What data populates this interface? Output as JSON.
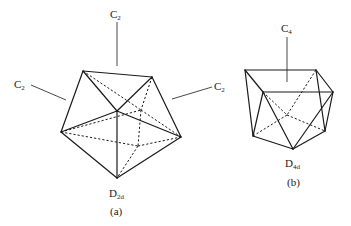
{
  "figure": {
    "panels": [
      {
        "id": "a",
        "caption": "(a)",
        "point_group": {
          "main": "D",
          "sub": "2d"
        },
        "axes": [
          {
            "label_main": "C",
            "label_sub": "2",
            "position": "top"
          },
          {
            "label_main": "C",
            "label_sub": "2",
            "position": "left"
          },
          {
            "label_main": "C",
            "label_sub": "2",
            "position": "right"
          }
        ],
        "vertices": {
          "TL": [
            83,
            71
          ],
          "TR": [
            152,
            77
          ],
          "C": [
            117,
            111
          ],
          "L": [
            61,
            132
          ],
          "R": [
            181,
            137
          ],
          "B": [
            117,
            178
          ],
          "H1": [
            141,
            110
          ],
          "H2": [
            138,
            146
          ]
        },
        "solid_edges": [
          [
            "TL",
            "TR"
          ],
          [
            "TL",
            "L"
          ],
          [
            "TL",
            "C"
          ],
          [
            "TR",
            "C"
          ],
          [
            "TR",
            "R"
          ],
          [
            "C",
            "L"
          ],
          [
            "C",
            "R"
          ],
          [
            "C",
            "B"
          ],
          [
            "L",
            "B"
          ],
          [
            "R",
            "B"
          ]
        ],
        "hidden_edges": [
          [
            "TL",
            "H1"
          ],
          [
            "H1",
            "R"
          ],
          [
            "TR",
            "H1"
          ],
          [
            "H1",
            "H2"
          ],
          [
            "H2",
            "B"
          ],
          [
            "L",
            "H1"
          ],
          [
            "L",
            "H2"
          ],
          [
            "H2",
            "R"
          ]
        ]
      },
      {
        "id": "b",
        "caption": "(b)",
        "point_group": {
          "main": "D",
          "sub": "4d"
        },
        "axes": [
          {
            "label_main": "C",
            "label_sub": "4",
            "position": "top"
          }
        ],
        "vertices": {
          "A": [
            245,
            70
          ],
          "B": [
            316,
            70
          ],
          "C": [
            263,
            92
          ],
          "D": [
            333,
            92
          ],
          "E": [
            253,
            136
          ],
          "F": [
            293,
            149
          ],
          "G": [
            325,
            131
          ],
          "H": [
            287,
            115
          ]
        },
        "solid_edges": [
          [
            "A",
            "B"
          ],
          [
            "A",
            "C"
          ],
          [
            "C",
            "D"
          ],
          [
            "B",
            "D"
          ],
          [
            "A",
            "E"
          ],
          [
            "C",
            "E"
          ],
          [
            "C",
            "F"
          ],
          [
            "E",
            "F"
          ],
          [
            "D",
            "F"
          ],
          [
            "D",
            "G"
          ],
          [
            "B",
            "G"
          ],
          [
            "F",
            "G"
          ]
        ],
        "hidden_edges": [
          [
            "C",
            "H"
          ],
          [
            "H",
            "G"
          ],
          [
            "E",
            "H"
          ],
          [
            "B",
            "H"
          ]
        ]
      }
    ]
  }
}
